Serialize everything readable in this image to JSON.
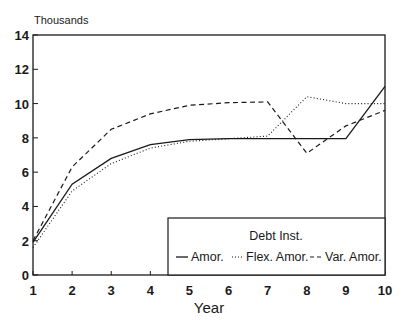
{
  "chart_data": {
    "type": "line",
    "title": "",
    "units_label": "Thousands",
    "xlabel": "Year",
    "ylabel": "",
    "x": [
      1,
      2,
      3,
      4,
      5,
      6,
      7,
      8,
      9,
      10
    ],
    "x_ticks": [
      "1",
      "2",
      "3",
      "4",
      "5",
      "6",
      "7",
      "8",
      "9",
      "10"
    ],
    "y_ticks": [
      "0",
      "2",
      "4",
      "6",
      "8",
      "10",
      "12",
      "14"
    ],
    "ylim": [
      0,
      14
    ],
    "xlim": [
      1,
      10
    ],
    "grid": false,
    "legend": {
      "title": "Debt Inst.",
      "position": "lower right",
      "entries": [
        "Amor.",
        "Flex. Amor.",
        "Var. Amor."
      ]
    },
    "series": [
      {
        "name": "Amor.",
        "style": "solid",
        "values": [
          1.9,
          5.3,
          6.8,
          7.6,
          7.9,
          7.95,
          7.95,
          7.95,
          7.95,
          11.0
        ]
      },
      {
        "name": "Flex. Amor.",
        "style": "dotted",
        "values": [
          1.6,
          4.9,
          6.5,
          7.4,
          7.8,
          7.95,
          8.1,
          10.4,
          10.0,
          10.0
        ]
      },
      {
        "name": "Var. Amor.",
        "style": "dashed",
        "values": [
          2.0,
          6.3,
          8.5,
          9.4,
          9.9,
          10.05,
          10.1,
          7.1,
          8.7,
          9.6
        ]
      }
    ]
  },
  "colors": {
    "line": "#1a1a1a",
    "background": "#ffffff"
  }
}
